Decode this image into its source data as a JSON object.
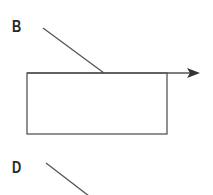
{
  "figure": {
    "panels": [
      {
        "label": "B"
      },
      {
        "label": "D"
      }
    ],
    "stroke_color": "#555555",
    "label_color": "#2a2a2a"
  }
}
